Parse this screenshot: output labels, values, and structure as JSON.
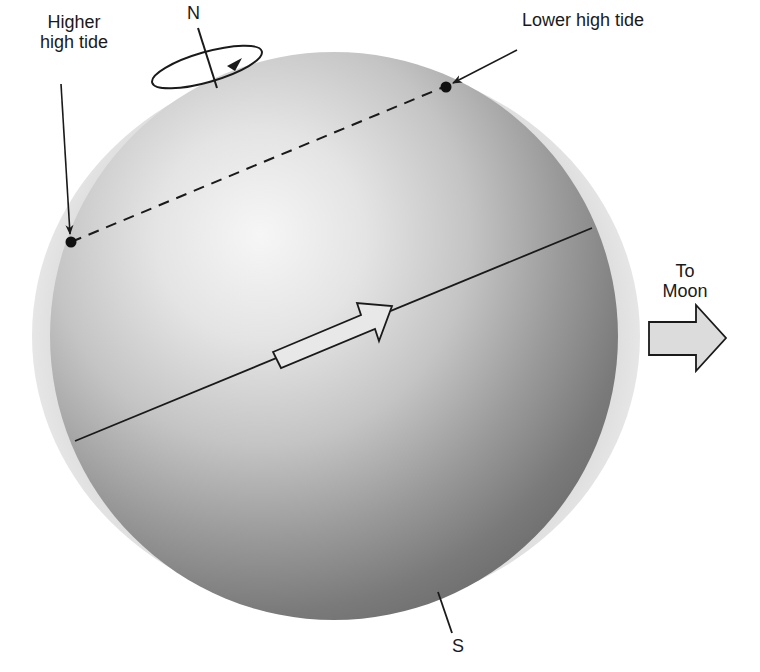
{
  "diagram": {
    "labels": {
      "higher_high_tide_line1": "Higher",
      "higher_high_tide_line2": "high tide",
      "lower_high_tide": "Lower high tide",
      "north_pole": "N",
      "south_pole": "S",
      "to_moon_line1": "To",
      "to_moon_line2": "Moon"
    },
    "colors": {
      "tidal_bulge": "#e2e2e2",
      "sphere_highlight": "#f4f4f4",
      "sphere_mid": "#c8c8c8",
      "sphere_shadow": "#7c7c7c",
      "line": "#1a1a1a",
      "moon_arrow_fill": "#dcdcdc",
      "rotation_arrow_fill": "#e6e6e6"
    },
    "elements": [
      {
        "id": "tidal-bulge",
        "type": "ellipse",
        "description": "Water bulge elongated toward the Moon"
      },
      {
        "id": "earth",
        "type": "sphere",
        "description": "Shaded Earth with tilted axis"
      },
      {
        "id": "equator",
        "type": "line",
        "description": "Equator, tilted"
      },
      {
        "id": "latitude-path",
        "type": "dashed-line",
        "description": "Path of a point at fixed latitude, connecting the two high tides"
      },
      {
        "id": "higher-high-tide-point",
        "type": "dot"
      },
      {
        "id": "lower-high-tide-point",
        "type": "dot"
      },
      {
        "id": "rotation-direction-arrow",
        "type": "arrow",
        "description": "Direction of Earth's rotation along equator"
      },
      {
        "id": "north-axis",
        "type": "line"
      },
      {
        "id": "rotation-ellipse",
        "type": "ellipse-arrow",
        "description": "Rotation indicator at north pole"
      },
      {
        "id": "south-axis",
        "type": "line"
      },
      {
        "id": "moon-direction-arrow",
        "type": "block-arrow",
        "description": "Direction toward the Moon"
      }
    ]
  }
}
